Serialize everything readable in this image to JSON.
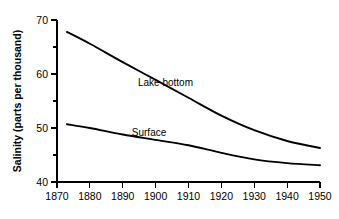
{
  "chart_data": {
    "type": "line",
    "title": "",
    "subtitle": "",
    "xlabel": "",
    "ylabel": "Salinity (parts per thousand)",
    "xlim": [
      1870,
      1950
    ],
    "ylim": [
      40,
      70
    ],
    "grid": false,
    "legend_position": "inline-annotation",
    "x_ticks": [
      1870,
      1880,
      1890,
      1900,
      1910,
      1920,
      1930,
      1940,
      1950
    ],
    "x_tick_labels": [
      "1870",
      "1880",
      "1890",
      "1900",
      "1910",
      "1920",
      "1930",
      "1940",
      "1950"
    ],
    "y_ticks": [
      40,
      45,
      50,
      55,
      60,
      65,
      70
    ],
    "y_tick_labels": [
      "40",
      "",
      "50",
      "",
      "60",
      "",
      "70"
    ],
    "y_major_ticks": [
      40,
      50,
      60,
      70
    ],
    "y_minor_ticks": [
      45,
      55,
      65
    ],
    "series": [
      {
        "name": "Lake bottom",
        "label_x": 1903,
        "label_y": 57.8,
        "x": [
          1873,
          1880,
          1890,
          1900,
          1910,
          1920,
          1930,
          1940,
          1950
        ],
        "values": [
          67.8,
          65.6,
          62.2,
          58.9,
          55.6,
          52.3,
          49.6,
          47.6,
          46.3
        ]
      },
      {
        "name": "Surface",
        "label_x": 1898,
        "label_y": 48.6,
        "x": [
          1873,
          1880,
          1890,
          1900,
          1910,
          1920,
          1930,
          1940,
          1950
        ],
        "values": [
          50.7,
          50.0,
          48.8,
          47.8,
          46.8,
          45.4,
          44.2,
          43.5,
          43.1
        ]
      }
    ]
  },
  "axis": {
    "y_title": "Salinity (parts per thousand)"
  },
  "annotations": {
    "lake_bottom": "Lake bottom",
    "surface": "Surface"
  },
  "colors": {
    "curve": "#000000",
    "axis": "#000000",
    "background": "#ffffff"
  }
}
